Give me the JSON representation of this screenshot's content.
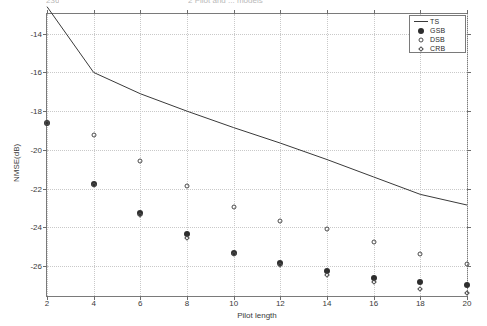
{
  "page_header": {
    "left_fragment": "236",
    "center_fragment": "2 Pilot and ... models"
  },
  "chart_data": {
    "type": "line",
    "title": "",
    "xlabel": "Pilot length",
    "ylabel": "NMSE(dB)",
    "xlim": [
      2,
      20
    ],
    "ylim": [
      -27.55,
      -12.98
    ],
    "xticks": [
      2,
      4,
      6,
      8,
      10,
      12,
      14,
      16,
      18,
      20
    ],
    "yticks": [
      -14,
      -16,
      -18,
      -20,
      -22,
      -24,
      -26
    ],
    "xticklabels": [
      "2",
      "4",
      "6",
      "8",
      "10",
      "12",
      "14",
      "16",
      "18",
      "20"
    ],
    "yticklabels": [
      "-14",
      "-16",
      "-18",
      "-20",
      "-22",
      "-24",
      "-26"
    ],
    "grid": true,
    "legend_position": "upper right",
    "x": [
      2,
      4,
      6,
      8,
      10,
      12,
      14,
      16,
      18,
      20
    ],
    "series": [
      {
        "name": "TS",
        "marker": "none",
        "style": "solid-line",
        "color": "#3a3a3a",
        "values": [
          -12.6,
          -16.0,
          -17.1,
          -18.0,
          -18.85,
          -19.65,
          -20.5,
          -21.4,
          -22.3,
          -22.85
        ]
      },
      {
        "name": "GSB",
        "marker": "filled-dot",
        "style": "markers",
        "color": "#2e2e2e",
        "values": [
          -18.6,
          -21.75,
          -23.25,
          -24.35,
          -25.35,
          -25.85,
          -26.25,
          -26.6,
          -26.85,
          -27.0
        ]
      },
      {
        "name": "DSB",
        "marker": "open-circle",
        "style": "markers",
        "color": "#4a4a4a",
        "values": [
          -18.6,
          -19.25,
          -20.6,
          -21.85,
          -22.95,
          -23.65,
          -24.1,
          -24.75,
          -25.4,
          -25.9
        ]
      },
      {
        "name": "CRB",
        "marker": "open-diamond",
        "style": "markers",
        "color": "#4a4a4a",
        "values": [
          -18.6,
          -21.8,
          -23.35,
          -24.55,
          -25.4,
          -25.95,
          -26.45,
          -26.85,
          -27.2,
          -27.4
        ]
      }
    ]
  },
  "legend": {
    "entries": [
      {
        "label": "TS",
        "symbol": "line"
      },
      {
        "label": "GSB",
        "symbol": "filled-dot"
      },
      {
        "label": "DSB",
        "symbol": "open-circle"
      },
      {
        "label": "CRB",
        "symbol": "open-diamond"
      }
    ]
  }
}
